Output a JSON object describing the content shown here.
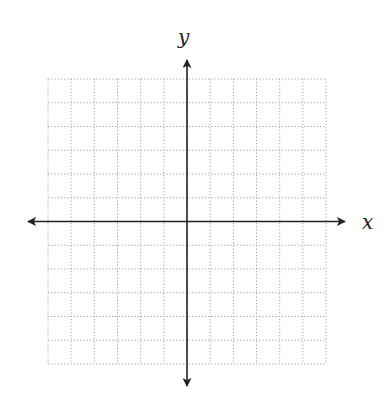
{
  "chart_data": {
    "type": "coordinate-grid",
    "title": "",
    "xlabel": "x",
    "ylabel": "y",
    "grid": true,
    "grid_style": "dotted",
    "columns": 12,
    "rows": 12,
    "x_range": [
      -6,
      6
    ],
    "y_range": [
      -6,
      6
    ],
    "tick_labels": [],
    "series": []
  },
  "colors": {
    "axis": "#222222",
    "grid": "#9a9a9a",
    "background": "#ffffff"
  },
  "labels": {
    "x_axis": "x",
    "y_axis": "y"
  }
}
